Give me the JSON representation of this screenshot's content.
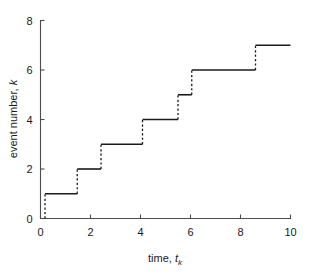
{
  "chart_data": {
    "type": "line",
    "subtype": "step-counting-process",
    "title": "",
    "xlabel": "time, t_k",
    "xlabel_parts": {
      "prefix": "time, ",
      "symbol": "t",
      "subscript": "k"
    },
    "ylabel": "event number, k",
    "ylabel_parts": {
      "prefix": "event number, ",
      "symbol": "k"
    },
    "xlim": [
      0,
      10
    ],
    "ylim": [
      0,
      8
    ],
    "xticks": [
      0,
      2,
      4,
      6,
      8,
      10
    ],
    "xtick_labels": [
      "0",
      "2",
      "4",
      "6",
      "8",
      "10"
    ],
    "yticks": [
      0,
      2,
      4,
      6,
      8
    ],
    "ytick_labels": [
      "0",
      "2",
      "4",
      "6",
      "8"
    ],
    "grid": false,
    "legend": false,
    "tick_direction": "in",
    "spines": [
      "left",
      "bottom"
    ],
    "event_times": [
      0.18,
      1.47,
      2.42,
      4.08,
      5.5,
      6.05,
      8.6
    ],
    "event_numbers": [
      1,
      2,
      3,
      4,
      5,
      6,
      7
    ],
    "series": [
      {
        "name": "counting process N(t)",
        "riser_style": "dashed",
        "plateau_style": "solid",
        "color": "#1a1a1a",
        "points": [
          {
            "t": 0.18,
            "k": 0
          },
          {
            "t": 0.18,
            "k": 1
          },
          {
            "t": 1.47,
            "k": 1
          },
          {
            "t": 1.47,
            "k": 2
          },
          {
            "t": 2.42,
            "k": 2
          },
          {
            "t": 2.42,
            "k": 3
          },
          {
            "t": 4.08,
            "k": 3
          },
          {
            "t": 4.08,
            "k": 4
          },
          {
            "t": 5.5,
            "k": 4
          },
          {
            "t": 5.5,
            "k": 5
          },
          {
            "t": 6.05,
            "k": 5
          },
          {
            "t": 6.05,
            "k": 6
          },
          {
            "t": 8.6,
            "k": 6
          },
          {
            "t": 8.6,
            "k": 7
          },
          {
            "t": 10.0,
            "k": 7
          }
        ]
      }
    ]
  },
  "colors": {
    "line": "#1a1a1a",
    "axis": "#4d4d4d",
    "background": "#ffffff"
  }
}
